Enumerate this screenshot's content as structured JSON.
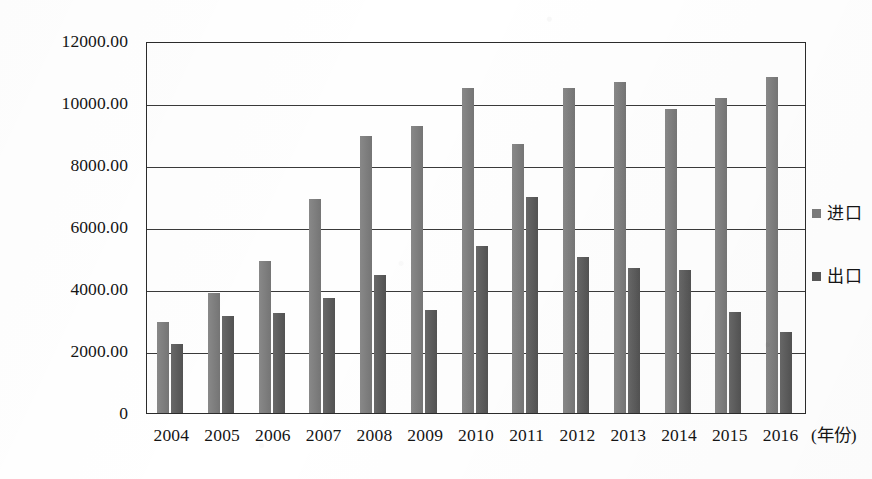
{
  "chart_data": {
    "type": "bar",
    "title": "",
    "subtitle": "",
    "xlabel": "(年份)",
    "ylabel": "",
    "categories": [
      "2004",
      "2005",
      "2006",
      "2007",
      "2008",
      "2009",
      "2010",
      "2011",
      "2012",
      "2013",
      "2014",
      "2015",
      "2016"
    ],
    "series": [
      {
        "name": "进口",
        "color": "#7b7b7b",
        "values": [
          2935,
          3880,
          4900,
          6900,
          8935,
          9250,
          10470,
          8680,
          10500,
          10680,
          9820,
          10170,
          10850
        ]
      },
      {
        "name": "出口",
        "color": "#575757",
        "values": [
          2225,
          3130,
          3220,
          3700,
          4460,
          3320,
          5380,
          6970,
          5020,
          4680,
          4600,
          3250,
          2600
        ]
      }
    ],
    "ylim": [
      0,
      12000
    ],
    "ytick_values": [
      0,
      2000,
      4000,
      6000,
      8000,
      10000,
      12000
    ],
    "ytick_labels": [
      "0",
      "2000.00",
      "4000.00",
      "6000.00",
      "8000.00",
      "10000.00",
      "12000.00"
    ],
    "grid": true,
    "legend_position": "right"
  },
  "legend": {
    "items": [
      {
        "label": "进口",
        "marker": "square-swatch-icon"
      },
      {
        "label": "出口",
        "marker": "square-swatch-icon"
      }
    ]
  }
}
